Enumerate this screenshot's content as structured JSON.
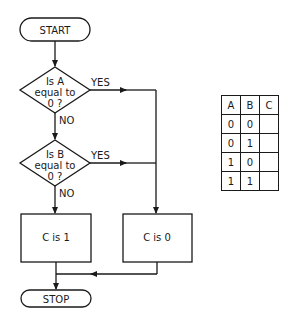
{
  "flowchart": {
    "start": "START",
    "decision_a": [
      "Is A",
      "equal to",
      "0 ?"
    ],
    "decision_b": [
      "Is B",
      "equal to",
      "0 ?"
    ],
    "yes_label": "YES",
    "no_label": "NO",
    "process_c1": "C is 1",
    "process_c0": "C is 0",
    "stop": "STOP"
  },
  "truth_table": {
    "headers": [
      "A",
      "B",
      "C"
    ],
    "rows": [
      [
        "0",
        "0",
        ""
      ],
      [
        "0",
        "1",
        ""
      ],
      [
        "1",
        "0",
        ""
      ],
      [
        "1",
        "1",
        ""
      ]
    ]
  },
  "colors": {
    "ink": "#1a1a1a",
    "background": "#ffffff"
  }
}
